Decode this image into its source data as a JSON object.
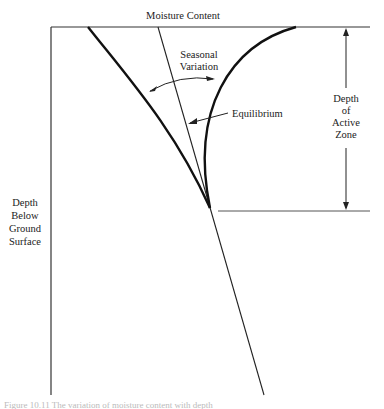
{
  "diagram": {
    "title": "Moisture Content",
    "labels": {
      "seasonal_variation": [
        "Seasonal",
        "Variation"
      ],
      "equilibrium": "Equilibrium",
      "depth_active_zone": [
        "Depth",
        "of",
        "Active",
        "Zone"
      ],
      "depth_below_ground": [
        "Depth",
        "Below",
        "Ground",
        "Surface"
      ]
    },
    "caption": "Figure 10.11  The variation of moisture content with depth"
  }
}
